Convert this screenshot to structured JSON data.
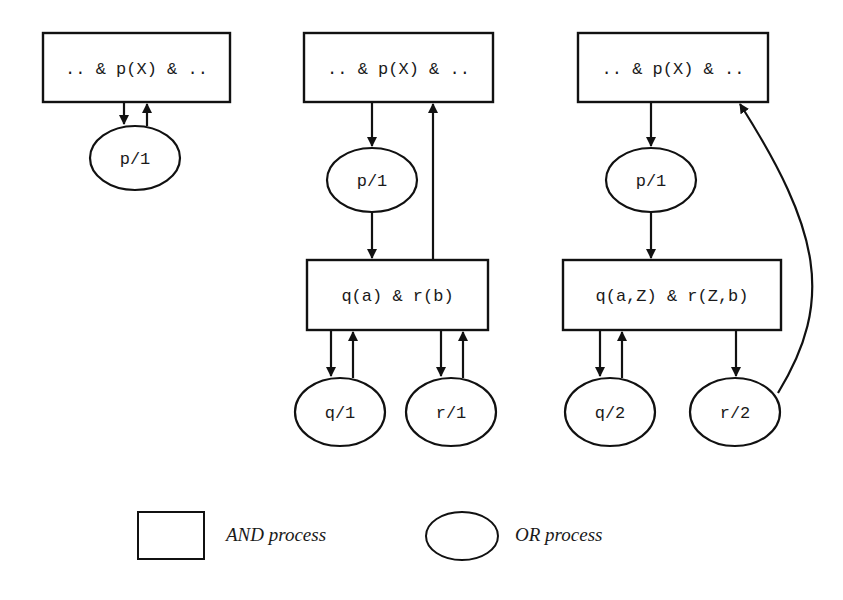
{
  "diagram": {
    "panels": [
      {
        "id": "panel-1",
        "and_top": ".. & p(X) & ..",
        "or_p": "p/1"
      },
      {
        "id": "panel-2",
        "and_top": ".. & p(X) & ..",
        "or_p": "p/1",
        "and_body": "q(a) & r(b)",
        "or_q": "q/1",
        "or_r": "r/1"
      },
      {
        "id": "panel-3",
        "and_top": ".. & p(X) & ..",
        "or_p": "p/1",
        "and_body": "q(a,Z) & r(Z,b)",
        "or_q": "q/2",
        "or_r": "r/2"
      }
    ],
    "legend": {
      "and_label": "AND process",
      "or_label": "OR process"
    },
    "colors": {
      "stroke": "#111111",
      "background": "#ffffff"
    }
  }
}
